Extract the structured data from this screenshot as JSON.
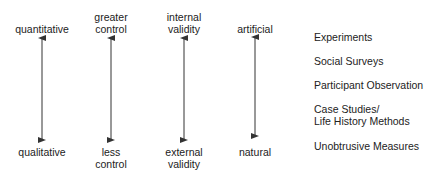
{
  "scales": [
    {
      "top": "quantitative",
      "bottom": "qualitative",
      "x": 42
    },
    {
      "top": "greater\ncontrol",
      "bottom": "less\ncontrol",
      "x": 111
    },
    {
      "top": "internal\nvalidity",
      "bottom": "external\nvalidity",
      "x": 184
    },
    {
      "top": "artificial",
      "bottom": "natural",
      "x": 255
    }
  ],
  "methods": [
    "Experiments",
    "Social Surveys",
    "Participant Observation",
    "Case Studies/\nLife History Methods",
    "Unobtrusive Measures"
  ],
  "colors": {
    "text": "#222222",
    "arrow": "#333333",
    "background": "#ffffff"
  }
}
